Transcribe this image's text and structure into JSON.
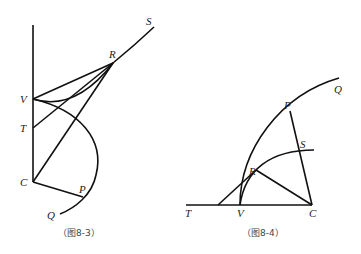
{
  "figures": [
    {
      "caption": "（图8-3）",
      "labels": {
        "S": "S",
        "R": "R",
        "V": "V",
        "T": "T",
        "C": "C",
        "P": "P",
        "Q": "Q"
      }
    },
    {
      "caption": "（图8-4）",
      "labels": {
        "Q": "Q",
        "P": "P",
        "S": "S",
        "R": "R",
        "T": "T",
        "V": "V",
        "C": "C"
      }
    }
  ]
}
